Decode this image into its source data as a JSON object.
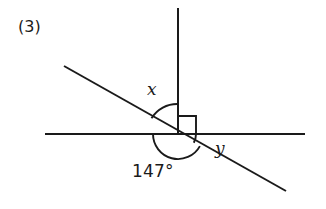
{
  "figure": {
    "item_number": "(3)",
    "background_color": "#ffffff",
    "stroke_color": "#1a1a1a",
    "width": 326,
    "height": 209
  },
  "labels": {
    "angle_x": "x",
    "angle_y": "y",
    "angle_known": "147°"
  },
  "geometry": {
    "vertex": {
      "x": 178,
      "y": 134
    },
    "horizontal_line": {
      "x1": 45,
      "y1": 134,
      "x2": 305,
      "y2": 134
    },
    "vertical_ray": {
      "x1": 178,
      "y1": 8,
      "x2": 178,
      "y2": 134
    },
    "transversal": {
      "x1": 64,
      "y1": 66,
      "x2": 286,
      "y2": 191
    },
    "right_angle_marker": {
      "x": 178,
      "y": 116,
      "size": 18
    },
    "arc_x": {
      "radius": 30,
      "start_deg": 180,
      "end_deg": 90
    },
    "arc_known": {
      "radius": 25,
      "start_deg": 180,
      "end_deg": 331
    },
    "arc_y": {
      "radius": 18,
      "start_deg": 331,
      "end_deg": 360
    }
  }
}
